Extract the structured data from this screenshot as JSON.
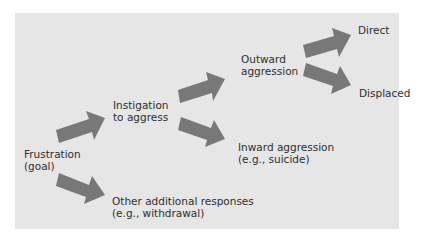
{
  "diagram": {
    "type": "flowchart",
    "background_color": "#e6e6e6",
    "arrow_color": "#787878",
    "text_color": "#2e2e2e",
    "nodes": {
      "frustration": {
        "line1": "Frustration",
        "line2": "(goal)"
      },
      "instigation": {
        "line1": "Instigation",
        "line2": "to aggress"
      },
      "other": {
        "line1": "Other additional responses",
        "line2": "(e.g., withdrawal)"
      },
      "outward": {
        "line1": "Outward",
        "line2": "aggression"
      },
      "inward": {
        "line1": "Inward aggression",
        "line2": "(e.g., suicide)"
      },
      "direct": {
        "line1": "Direct"
      },
      "displaced": {
        "line1": "Displaced"
      }
    },
    "edges": [
      {
        "from": "Frustration (goal)",
        "to": "Instigation to aggress"
      },
      {
        "from": "Frustration (goal)",
        "to": "Other additional responses (e.g., withdrawal)"
      },
      {
        "from": "Instigation to aggress",
        "to": "Outward aggression"
      },
      {
        "from": "Instigation to aggress",
        "to": "Inward aggression (e.g., suicide)"
      },
      {
        "from": "Outward aggression",
        "to": "Direct"
      },
      {
        "from": "Outward aggression",
        "to": "Displaced"
      }
    ]
  }
}
